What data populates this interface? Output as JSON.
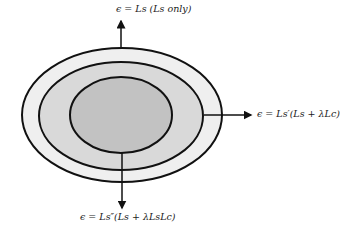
{
  "diagram": {
    "type": "nested-ellipses",
    "colors": {
      "outer_fill": "#efefef",
      "middle_fill": "#d9d9d9",
      "inner_fill": "#c2c2c2",
      "stroke": "#111111"
    },
    "labels": {
      "top": "ϵ = Ls (Ls only)",
      "right": "ϵ = Ls′(Ls + λLc)",
      "bottom": "ϵ = Ls″(Ls + λLsLc)"
    }
  }
}
